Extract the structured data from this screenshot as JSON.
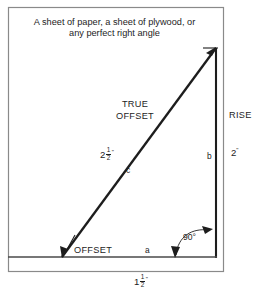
{
  "diagram": {
    "title_caption": {
      "line1": "A sheet of paper, a sheet of plywood, or",
      "line2": "any perfect right angle"
    },
    "labels": {
      "true_offset_line1": "TRUE",
      "true_offset_line2": "OFFSET",
      "rise": "RISE",
      "offset": "OFFSET",
      "side_a": "a",
      "side_b": "b",
      "side_c": "c",
      "angle_right": "90°"
    },
    "measurements": {
      "hypotenuse_whole": "2",
      "hypotenuse_num": "1",
      "hypotenuse_den": "2",
      "hypotenuse_inch": "\"",
      "rise_value": "2",
      "rise_inch": "\"",
      "base_whole": "1",
      "base_num": "1",
      "base_den": "2",
      "base_inch": "\""
    },
    "colors": {
      "ink": "#1d1d1d",
      "frame": "#8a8a8a",
      "paper": "#ffffff"
    },
    "geometry": {
      "frame": {
        "x": 8,
        "y": 7,
        "width": 216,
        "height": 265
      },
      "triangle": {
        "apex": [
          216,
          48
        ],
        "bottom_left": [
          62,
          257
        ],
        "bottom_right": [
          216,
          257
        ]
      }
    }
  }
}
